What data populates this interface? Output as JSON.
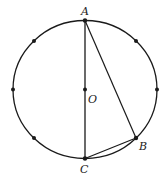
{
  "diagram": {
    "type": "circle-geometry",
    "circle": {
      "cx": 85,
      "cy": 89.5,
      "rx": 72,
      "ry": 69
    },
    "labels": {
      "A": "A",
      "B": "B",
      "C": "C",
      "O": "O"
    },
    "points": {
      "A": {
        "x": 85,
        "y": 20.5
      },
      "B": {
        "x": 136,
        "y": 138
      },
      "C": {
        "x": 85,
        "y": 158.5
      },
      "O": {
        "x": 85,
        "y": 89.5
      }
    },
    "segments": [
      "AC",
      "AB",
      "BC"
    ],
    "division_dots": 8,
    "stroke_color": "#1a1a1a"
  }
}
